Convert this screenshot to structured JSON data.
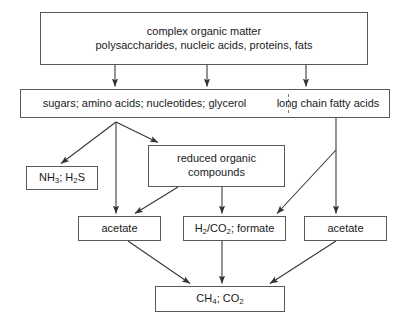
{
  "diagram": {
    "stroke_color": "#595959",
    "text_color": "#1a1a1a",
    "background": "#ffffff",
    "nodes": {
      "complex_organic_matter": {
        "line1": "complex organic matter",
        "line2": "polysaccharides, nucleic acids, proteins, fats"
      },
      "monomers": {
        "left": "sugars;  amino acids; nucleotides; glycerol",
        "right": "long chain fatty acids"
      },
      "nh3_h2s": "NH3; H2S",
      "reduced_organic": {
        "line1": "reduced organic",
        "line2": "compounds"
      },
      "acetate_left": "acetate",
      "h2_co2_formate": "H2/CO2; formate",
      "acetate_right": "acetate",
      "ch4_co2": "CH4; CO2"
    },
    "edges": [
      {
        "from": "complex_organic_matter",
        "to": "monomers",
        "label": ""
      },
      {
        "from": "complex_organic_matter",
        "to": "monomers",
        "label": ""
      },
      {
        "from": "complex_organic_matter",
        "to": "monomers",
        "label": ""
      },
      {
        "from": "monomers_left",
        "to": "nh3_h2s",
        "label": ""
      },
      {
        "from": "monomers_left",
        "to": "reduced_organic",
        "label": ""
      },
      {
        "from": "monomers_left",
        "to": "acetate_left",
        "label": ""
      },
      {
        "from": "reduced_organic",
        "to": "acetate_left",
        "label": ""
      },
      {
        "from": "reduced_organic",
        "to": "h2_co2_formate",
        "label": ""
      },
      {
        "from": "monomers_right",
        "to": "h2_co2_formate",
        "label": ""
      },
      {
        "from": "monomers_right",
        "to": "acetate_right",
        "label": ""
      },
      {
        "from": "acetate_left",
        "to": "ch4_co2",
        "label": ""
      },
      {
        "from": "h2_co2_formate",
        "to": "ch4_co2",
        "label": ""
      },
      {
        "from": "acetate_right",
        "to": "ch4_co2",
        "label": ""
      }
    ]
  }
}
